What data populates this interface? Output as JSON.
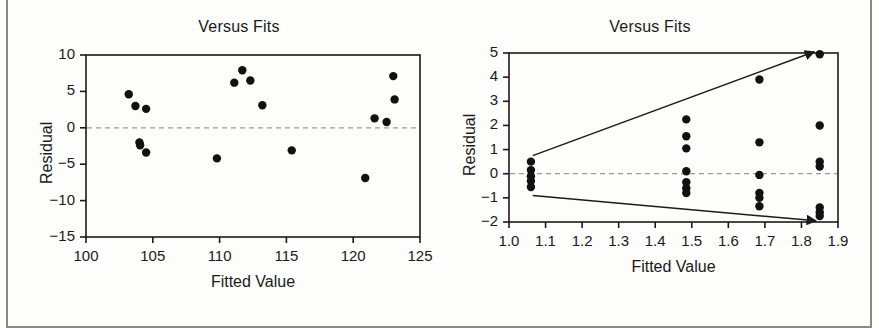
{
  "page": {
    "background_color": "#fdfdfc",
    "frame_color": "#8a8a8a",
    "ink_color": "#1a1a1a",
    "reference_line_color": "#9b9b9b"
  },
  "panels": [
    {
      "id": "left",
      "title": "Versus Fits",
      "xlabel": "Fitted Value",
      "ylabel": "Residual"
    },
    {
      "id": "right",
      "title": "Versus Fits",
      "xlabel": "Fitted Value",
      "ylabel": "Residual"
    }
  ],
  "chart_data": [
    {
      "type": "scatter",
      "id": "versus-fits-left",
      "title": "Versus Fits",
      "xlabel": "Fitted Value",
      "ylabel": "Residual",
      "xlim": [
        100,
        125
      ],
      "ylim": [
        -15,
        10
      ],
      "xticks": [
        100,
        105,
        110,
        115,
        120,
        125
      ],
      "yticks": [
        10,
        5,
        0,
        -5,
        -10,
        -15
      ],
      "xtick_labels": [
        "100",
        "105",
        "110",
        "115",
        "120",
        "125"
      ],
      "ytick_labels": [
        "10",
        "5",
        "0",
        "−5",
        "−10",
        "−15"
      ],
      "grid": false,
      "legend": false,
      "reference_line": {
        "axis": "y",
        "value": 0,
        "style": "dashed"
      },
      "marker": {
        "shape": "circle",
        "filled": true,
        "color": "#111111",
        "size": 5
      },
      "points": [
        {
          "x": 103.2,
          "y": 4.6
        },
        {
          "x": 103.7,
          "y": 3.0
        },
        {
          "x": 104.5,
          "y": 2.6
        },
        {
          "x": 104.0,
          "y": -2.0
        },
        {
          "x": 104.05,
          "y": -2.4
        },
        {
          "x": 104.5,
          "y": -3.4
        },
        {
          "x": 109.8,
          "y": -4.2
        },
        {
          "x": 111.1,
          "y": 6.2
        },
        {
          "x": 111.7,
          "y": 7.9
        },
        {
          "x": 112.3,
          "y": 6.5
        },
        {
          "x": 113.2,
          "y": 3.1
        },
        {
          "x": 115.4,
          "y": -3.1
        },
        {
          "x": 120.9,
          "y": -6.9
        },
        {
          "x": 121.6,
          "y": 1.3
        },
        {
          "x": 122.5,
          "y": 0.8
        },
        {
          "x": 123.0,
          "y": 7.1
        },
        {
          "x": 123.1,
          "y": 3.9
        }
      ]
    },
    {
      "type": "scatter",
      "id": "versus-fits-right",
      "title": "Versus Fits",
      "xlabel": "Fitted Value",
      "ylabel": "Residual",
      "xlim": [
        1.0,
        1.9
      ],
      "ylim": [
        -2,
        5
      ],
      "xticks": [
        1.0,
        1.1,
        1.2,
        1.3,
        1.4,
        1.5,
        1.6,
        1.7,
        1.8,
        1.9
      ],
      "yticks": [
        5,
        4,
        3,
        2,
        1,
        0,
        -1,
        -2
      ],
      "xtick_labels": [
        "1.0",
        "1.1",
        "1.2",
        "1.3",
        "1.4",
        "1.5",
        "1.6",
        "1.7",
        "1.8",
        "1.9"
      ],
      "ytick_labels": [
        "5",
        "4",
        "3",
        "2",
        "1",
        "0",
        "−1",
        "−2"
      ],
      "grid": false,
      "legend": false,
      "reference_line": {
        "axis": "y",
        "value": 0,
        "style": "dashed"
      },
      "marker": {
        "shape": "circle",
        "filled": true,
        "color": "#111111",
        "size": 5
      },
      "points": [
        {
          "x": 1.06,
          "y": 0.5
        },
        {
          "x": 1.06,
          "y": 0.15
        },
        {
          "x": 1.06,
          "y": -0.1
        },
        {
          "x": 1.06,
          "y": -0.3
        },
        {
          "x": 1.06,
          "y": -0.55
        },
        {
          "x": 1.485,
          "y": 2.25
        },
        {
          "x": 1.485,
          "y": 1.55
        },
        {
          "x": 1.485,
          "y": 1.05
        },
        {
          "x": 1.485,
          "y": 0.1
        },
        {
          "x": 1.485,
          "y": -0.35
        },
        {
          "x": 1.485,
          "y": -0.6
        },
        {
          "x": 1.485,
          "y": -0.8
        },
        {
          "x": 1.685,
          "y": 3.9
        },
        {
          "x": 1.685,
          "y": 1.3
        },
        {
          "x": 1.685,
          "y": -0.05
        },
        {
          "x": 1.685,
          "y": -0.8
        },
        {
          "x": 1.685,
          "y": -1.0
        },
        {
          "x": 1.685,
          "y": -1.35
        },
        {
          "x": 1.85,
          "y": 4.95
        },
        {
          "x": 1.85,
          "y": 2.0
        },
        {
          "x": 1.85,
          "y": 0.5
        },
        {
          "x": 1.85,
          "y": 0.3
        },
        {
          "x": 1.85,
          "y": -1.4
        },
        {
          "x": 1.85,
          "y": -1.6
        },
        {
          "x": 1.85,
          "y": -1.75
        }
      ],
      "annotations": [
        {
          "name": "upper-funnel-arrow",
          "type": "arrow",
          "from": {
            "x": 1.065,
            "y": 0.75
          },
          "to": {
            "x": 1.835,
            "y": 5.05
          }
        },
        {
          "name": "lower-funnel-arrow",
          "type": "arrow",
          "from": {
            "x": 1.065,
            "y": -0.9
          },
          "to": {
            "x": 1.84,
            "y": -1.95
          }
        }
      ]
    }
  ]
}
